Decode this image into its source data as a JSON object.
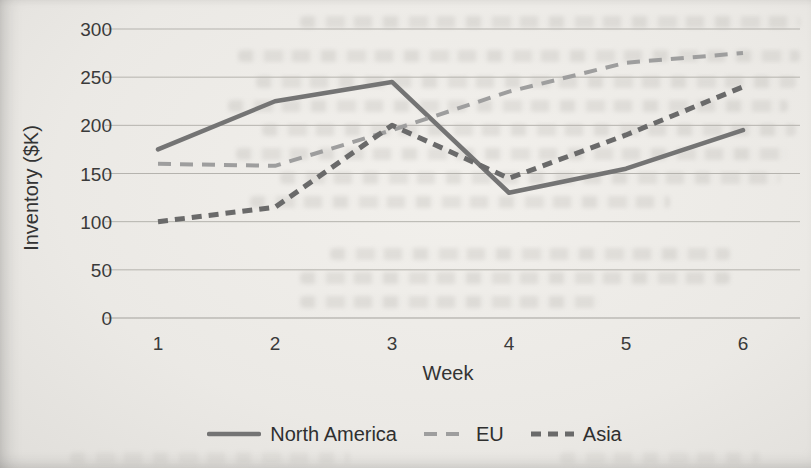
{
  "chart_data": {
    "type": "line",
    "title": "",
    "xlabel": "Week",
    "ylabel": "Inventory ($K)",
    "x": [
      1,
      2,
      3,
      4,
      5,
      6
    ],
    "xticks": [
      "1",
      "2",
      "3",
      "4",
      "5",
      "6"
    ],
    "yticks": [
      0,
      50,
      100,
      150,
      200,
      250,
      300
    ],
    "ylim": [
      0,
      300
    ],
    "grid": "horizontal",
    "legend_position": "bottom",
    "series": [
      {
        "name": "North America",
        "style": "solid",
        "color": "#747474",
        "values": [
          175,
          225,
          245,
          130,
          155,
          195
        ]
      },
      {
        "name": "EU",
        "style": "dashed",
        "color": "#9e9e9e",
        "values": [
          160,
          158,
          195,
          235,
          265,
          275
        ]
      },
      {
        "name": "Asia",
        "style": "dashed",
        "color": "#6a6a6a",
        "values": [
          100,
          115,
          200,
          145,
          190,
          240
        ]
      }
    ],
    "colors": {
      "gridline": "#b5b3ae",
      "text": "#3a3a3a",
      "paper": "#ebe9e5"
    }
  }
}
